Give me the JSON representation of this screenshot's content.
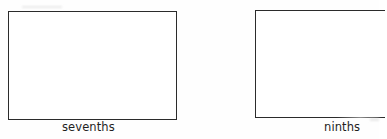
{
  "figure": {
    "background_color": "#fefefe",
    "line_color": "#2b2b2b",
    "caption_color": "#1f1f1f",
    "strips": [
      {
        "id": "sevenths",
        "caption": "sevenths",
        "divisions_drawn": 0,
        "cropped": false
      },
      {
        "id": "ninths",
        "caption": "ninths",
        "divisions_drawn": 0,
        "cropped": true
      }
    ]
  }
}
